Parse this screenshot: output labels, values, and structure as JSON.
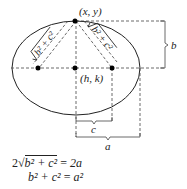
{
  "diagram": {
    "type": "ellipse-derivation",
    "colors": {
      "stroke": "#222222",
      "dash": "#444444",
      "point": "#000000"
    },
    "points": {
      "vertex": {
        "label": "(x, y)"
      },
      "center": {
        "label": "(h, k)"
      },
      "focus_left": {
        "label": ""
      },
      "focus_right": {
        "label": ""
      }
    },
    "segments": {
      "left_distance": {
        "label_radicand": "b² + c²"
      },
      "right_distance": {
        "label_radicand": "b² + c²"
      }
    },
    "braces": {
      "b": {
        "label": "b"
      },
      "c": {
        "label": "c"
      },
      "a": {
        "label": "a"
      }
    },
    "equations": [
      {
        "lhs_coef": "2",
        "lhs_radicand": "b² + c²",
        "eq": "=",
        "rhs": "2a"
      },
      {
        "lhs": "b² + c²",
        "eq": "=",
        "rhs": "a²"
      }
    ]
  }
}
